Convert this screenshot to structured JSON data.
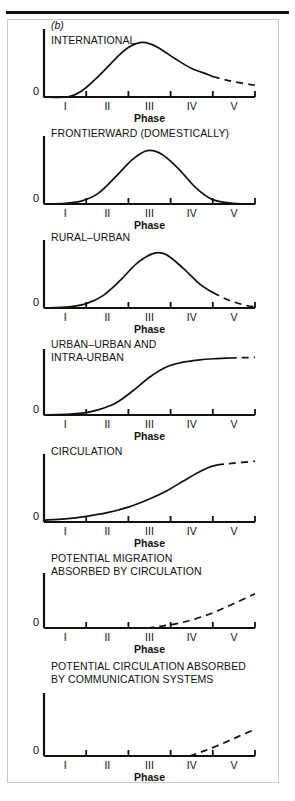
{
  "figure": {
    "panel_letter": "(b)",
    "axis_title": "Phase",
    "zero_label": "0",
    "tick_labels": [
      "I",
      "II",
      "III",
      "IV",
      "V"
    ]
  },
  "chart_data": {
    "type": "line",
    "title": "(b)",
    "xlabel": "Phase",
    "ylabel": "",
    "x": [
      "I",
      "II",
      "III",
      "IV",
      "V"
    ],
    "xlim": [
      0,
      5
    ],
    "ylim": [
      0,
      1
    ],
    "grid": false,
    "legend": "none",
    "panels": [
      {
        "label": "INTERNATIONAL",
        "shape": "skewed-bell",
        "solid_x": [
          0.0,
          0.55,
          0.9,
          1.3,
          1.7,
          2.0,
          2.35,
          2.7,
          3.1,
          3.5,
          3.9,
          4.0
        ],
        "solid_y": [
          0.0,
          0.0,
          0.1,
          0.34,
          0.62,
          0.8,
          0.88,
          0.8,
          0.62,
          0.46,
          0.36,
          0.33
        ],
        "dashed_x": [
          4.0,
          4.4,
          4.8,
          5.0
        ],
        "dashed_y": [
          0.33,
          0.26,
          0.21,
          0.19
        ]
      },
      {
        "label": "FRONTIERWARD (DOMESTICALLY)",
        "shape": "bell",
        "solid_x": [
          0.0,
          0.5,
          0.9,
          1.3,
          1.7,
          2.1,
          2.45,
          2.8,
          3.2,
          3.6,
          4.0,
          4.5,
          5.0
        ],
        "solid_y": [
          0.0,
          0.01,
          0.05,
          0.18,
          0.44,
          0.72,
          0.86,
          0.8,
          0.56,
          0.26,
          0.07,
          0.01,
          0.0
        ],
        "dashed_x": [],
        "dashed_y": []
      },
      {
        "label": "RURAL–URBAN",
        "shape": "bell-right-tail",
        "solid_x": [
          0.0,
          0.6,
          1.0,
          1.4,
          1.8,
          2.2,
          2.6,
          2.9,
          3.3,
          3.7,
          4.0
        ],
        "solid_y": [
          0.0,
          0.02,
          0.07,
          0.2,
          0.44,
          0.72,
          0.88,
          0.86,
          0.64,
          0.38,
          0.25
        ],
        "dashed_x": [
          4.0,
          4.4,
          4.8,
          5.0
        ],
        "dashed_y": [
          0.25,
          0.12,
          0.04,
          0.02
        ]
      },
      {
        "label": "URBAN–URBAN AND\nINTRA-URBAN",
        "shape": "logistic",
        "solid_x": [
          0.0,
          0.5,
          0.9,
          1.3,
          1.7,
          2.1,
          2.5,
          2.9,
          3.3,
          3.7,
          4.1,
          4.4
        ],
        "solid_y": [
          0.0,
          0.01,
          0.03,
          0.09,
          0.2,
          0.4,
          0.63,
          0.8,
          0.88,
          0.92,
          0.94,
          0.95
        ],
        "dashed_x": [
          4.4,
          4.7,
          5.0
        ],
        "dashed_y": [
          0.95,
          0.955,
          0.96
        ]
      },
      {
        "label": "CIRCULATION",
        "shape": "rising-logistic",
        "solid_x": [
          0.0,
          0.5,
          1.0,
          1.5,
          2.0,
          2.5,
          2.9,
          3.3,
          3.6,
          3.9,
          4.1
        ],
        "solid_y": [
          0.03,
          0.05,
          0.09,
          0.15,
          0.24,
          0.37,
          0.5,
          0.66,
          0.78,
          0.88,
          0.92
        ],
        "dashed_x": [
          4.1,
          4.5,
          5.0
        ],
        "dashed_y": [
          0.92,
          0.95,
          0.98
        ]
      },
      {
        "label": "POTENTIAL MIGRATION\nABSORBED BY CIRCULATION",
        "shape": "late-rise",
        "solid_x": [],
        "solid_y": [],
        "dashed_x": [
          2.45,
          2.8,
          3.2,
          3.6,
          4.0,
          4.4,
          4.8,
          5.0
        ],
        "dashed_y": [
          0.0,
          0.04,
          0.1,
          0.19,
          0.31,
          0.46,
          0.62,
          0.7
        ]
      },
      {
        "label": "POTENTIAL CIRCULATION ABSORBED\nBY COMMUNICATION SYSTEMS",
        "shape": "late-rise",
        "solid_x": [],
        "solid_y": [],
        "dashed_x": [
          3.45,
          3.8,
          4.2,
          4.6,
          5.0
        ],
        "dashed_y": [
          0.0,
          0.09,
          0.21,
          0.34,
          0.47
        ]
      }
    ]
  }
}
